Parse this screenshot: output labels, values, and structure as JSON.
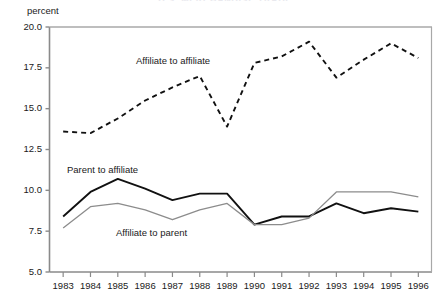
{
  "figure": {
    "title_remnant": "U.S. MERCHANDISE TRADE",
    "y_axis_label": "percent"
  },
  "chart_data": {
    "type": "line",
    "title": "",
    "xlabel": "",
    "ylabel": "percent",
    "xlim": [
      1982.5,
      1996.5
    ],
    "ylim": [
      5.0,
      20.0
    ],
    "grid": false,
    "legend_position": "inline-annotations",
    "x": [
      1983,
      1984,
      1985,
      1986,
      1987,
      1988,
      1989,
      1990,
      1991,
      1992,
      1993,
      1994,
      1995,
      1996
    ],
    "categories": [
      "1983",
      "1984",
      "1985",
      "1986",
      "1987",
      "1988",
      "1989",
      "1990",
      "1991",
      "1992",
      "1993",
      "1994",
      "1995",
      "1996"
    ],
    "ytick_labels": [
      "20.0",
      "17.5",
      "15.0",
      "12.5",
      "10.0",
      "7.5",
      "5.0"
    ],
    "ytick_values": [
      20.0,
      17.5,
      15.0,
      12.5,
      10.0,
      7.5,
      5.0
    ],
    "series": [
      {
        "name": "Affiliate to affiliate",
        "style": "dashed",
        "color": "#111111",
        "values": [
          13.6,
          13.5,
          14.4,
          15.5,
          16.3,
          17.0,
          13.9,
          17.8,
          18.2,
          19.1,
          16.9,
          18.0,
          19.0,
          18.1
        ]
      },
      {
        "name": "Parent to affiliate",
        "style": "solid",
        "color": "#111111",
        "values": [
          8.4,
          9.9,
          10.7,
          10.1,
          9.4,
          9.8,
          9.8,
          7.9,
          8.4,
          8.4,
          9.2,
          8.6,
          8.9,
          8.7
        ]
      },
      {
        "name": "Affiliate to parent",
        "style": "solid",
        "color": "#8c8c8c",
        "values": [
          7.7,
          9.0,
          9.2,
          8.8,
          8.2,
          8.8,
          9.2,
          7.9,
          7.9,
          8.3,
          9.9,
          9.9,
          9.9,
          9.6
        ]
      }
    ],
    "annotations": [
      {
        "text": "Affiliate to affiliate",
        "series": "Affiliate to affiliate",
        "x": 136,
        "y": 55
      },
      {
        "text": "Parent to affiliate",
        "series": "Parent to affiliate",
        "x": 67,
        "y": 164
      },
      {
        "text": "Affiliate to parent",
        "series": "Affiliate to parent",
        "x": 116,
        "y": 227
      }
    ]
  },
  "colors": {
    "axis": "#8a8a8a",
    "dashed_series": "#111111",
    "solid_black_series": "#111111",
    "solid_grey_series": "#8c8c8c",
    "background": "#ffffff",
    "text": "#1a1a1a"
  }
}
